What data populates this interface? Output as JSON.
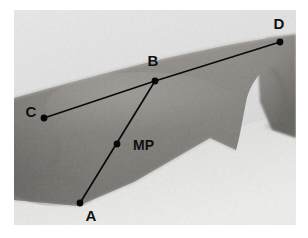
{
  "figure": {
    "kind": "annotated-photograph",
    "canvas": {
      "width": 308,
      "height": 238,
      "background": "#ffffff"
    },
    "photo": {
      "x": 14,
      "y": 10,
      "width": 282,
      "height": 215,
      "background_tone": "#d7d7d7",
      "skin_tone": "#8f8d8a",
      "skin_tone_dark": "#76736f",
      "skin_tone_light": "#a3a09c",
      "backdrop_light": "#e3e3e3",
      "backdrop_lower": "#dcdcda"
    },
    "points": [
      {
        "id": "A",
        "label": "A",
        "x": 80,
        "y": 203,
        "label_x": 91,
        "label_y": 221,
        "label_anchor": "middle"
      },
      {
        "id": "B",
        "label": "B",
        "x": 155,
        "y": 81,
        "label_x": 153,
        "label_y": 66,
        "label_anchor": "middle"
      },
      {
        "id": "C",
        "label": "C",
        "x": 44,
        "y": 118,
        "label_x": 31,
        "label_y": 117,
        "label_anchor": "middle"
      },
      {
        "id": "D",
        "label": "D",
        "x": 280,
        "y": 42,
        "label_x": 279,
        "label_y": 29,
        "label_anchor": "middle"
      },
      {
        "id": "MP",
        "label": "MP",
        "x": 117,
        "y": 144,
        "label_x": 133,
        "label_y": 150,
        "label_anchor": "start"
      }
    ],
    "segments": [
      {
        "id": "C-B",
        "from": "C",
        "to": "B"
      },
      {
        "id": "B-D",
        "from": "B",
        "to": "D"
      },
      {
        "id": "A-B",
        "from": "A",
        "to": "B"
      }
    ],
    "marker_radius": 3.4,
    "line_color": "#0b0b0b",
    "label_color": "#101010"
  }
}
